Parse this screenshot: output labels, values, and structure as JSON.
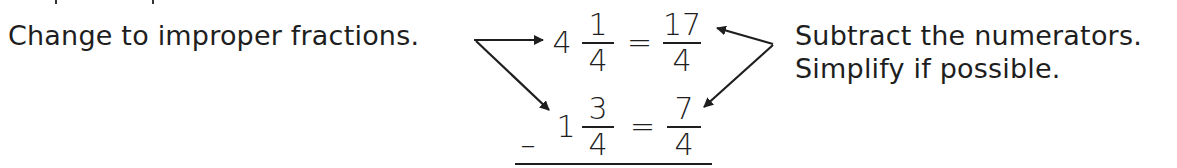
{
  "left_instruction": "Change to improper fractions.",
  "right_instructions": {
    "line1": "Subtract the numerators.",
    "line2": "Simplify if possible."
  },
  "problem": {
    "row1": {
      "whole": "4",
      "numerator": "1",
      "denominator": "4",
      "equals": "=",
      "improper_numerator": "17",
      "improper_denominator": "4"
    },
    "row2": {
      "operator": "–",
      "whole": "1",
      "numerator": "3",
      "denominator": "4",
      "equals": "=",
      "improper_numerator": "7",
      "improper_denominator": "4"
    }
  },
  "colors": {
    "ink": "#1e1e1e",
    "background": "#ffffff"
  }
}
